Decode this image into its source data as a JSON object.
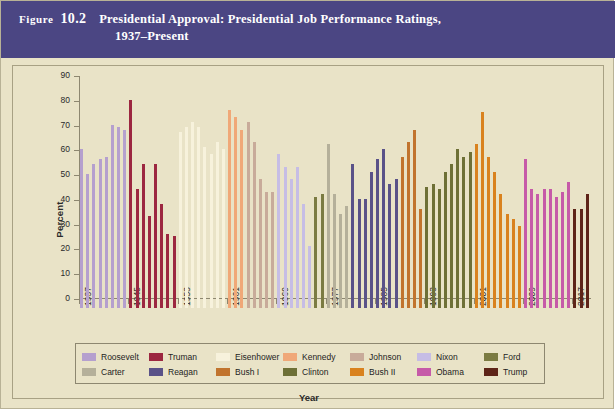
{
  "figure": {
    "label_word": "Figure",
    "number": "10.2",
    "title_line_1": "Presidential Approval: Presidential Job Performance Ratings,",
    "title_line_2": "1937–Present",
    "title_bar_color": "#4b4683",
    "background_color": "#e9e3c7"
  },
  "chart_data": {
    "type": "bar",
    "title": "Presidential Approval: Presidential Job Performance Ratings, 1937–Present",
    "xlabel": "Year",
    "ylabel": "Percent",
    "ylim": [
      0,
      90
    ],
    "ytick_labels": [
      "0",
      "10",
      "20",
      "30",
      "40",
      "50",
      "60",
      "70",
      "80",
      "90"
    ],
    "yticks": [
      0,
      10,
      20,
      30,
      40,
      50,
      60,
      70,
      80,
      90
    ],
    "xtick_labels": [
      "1937",
      "1945",
      "1953",
      "1961",
      "1969",
      "1977",
      "1985",
      "1993",
      "2001",
      "2009",
      "2017"
    ],
    "xticks": [
      1937,
      1945,
      1953,
      1961,
      1969,
      1977,
      1985,
      1993,
      2001,
      2009,
      2017
    ],
    "x_start": 1937,
    "x_end": 2020,
    "grid": false,
    "legend_position": "bottom",
    "series": [
      {
        "name": "Roosevelt",
        "color": "#b5a0ce",
        "x": [
          1937,
          1938,
          1939,
          1940,
          1941,
          1942,
          1943,
          1944
        ],
        "values": [
          64,
          54,
          58,
          60,
          61,
          74,
          73,
          72
        ]
      },
      {
        "name": "Truman",
        "color": "#9c2740",
        "x": [
          1945,
          1946,
          1947,
          1948,
          1949,
          1950,
          1951,
          1952
        ],
        "values": [
          84,
          48,
          58,
          37,
          58,
          42,
          30,
          29
        ]
      },
      {
        "name": "Eisenhower",
        "color": "#f7f2dc",
        "x": [
          1953,
          1954,
          1955,
          1956,
          1957,
          1958,
          1959,
          1960
        ],
        "values": [
          71,
          73,
          75,
          73,
          65,
          62,
          67,
          64
        ]
      },
      {
        "name": "Kennedy",
        "color": "#f0a878",
        "x": [
          1961,
          1962,
          1963
        ],
        "values": [
          80,
          77,
          72
        ]
      },
      {
        "name": "Johnson",
        "color": "#c8ab9a",
        "x": [
          1964,
          1965,
          1966,
          1967,
          1968
        ],
        "values": [
          75,
          67,
          52,
          47,
          47
        ]
      },
      {
        "name": "Nixon",
        "color": "#c6bde5",
        "x": [
          1969,
          1970,
          1971,
          1972,
          1973,
          1974
        ],
        "values": [
          62,
          57,
          52,
          57,
          42,
          25
        ]
      },
      {
        "name": "Ford",
        "color": "#7b7b42",
        "x": [
          1975,
          1976
        ],
        "values": [
          45,
          46
        ]
      },
      {
        "name": "Carter",
        "color": "#b5b09a",
        "x": [
          1977,
          1978,
          1979,
          1980
        ],
        "values": [
          66,
          46,
          38,
          41
        ]
      },
      {
        "name": "Reagan",
        "color": "#5a5288",
        "x": [
          1981,
          1982,
          1983,
          1984,
          1985,
          1986,
          1987,
          1988
        ],
        "values": [
          58,
          44,
          44,
          55,
          60,
          64,
          50,
          52
        ]
      },
      {
        "name": "Bush I",
        "color": "#c1742e",
        "x": [
          1989,
          1990,
          1991,
          1992
        ],
        "values": [
          61,
          67,
          72,
          40
        ]
      },
      {
        "name": "Clinton",
        "color": "#6e7036",
        "x": [
          1993,
          1994,
          1995,
          1996,
          1997,
          1998,
          1999,
          2000
        ],
        "values": [
          49,
          50,
          48,
          55,
          58,
          64,
          61,
          63
        ]
      },
      {
        "name": "Bush II",
        "color": "#d9821e",
        "x": [
          2001,
          2002,
          2003,
          2004,
          2005,
          2006,
          2007,
          2008
        ],
        "values": [
          66,
          79,
          61,
          55,
          46,
          38,
          36,
          33
        ]
      },
      {
        "name": "Obama",
        "color": "#c65aa8",
        "x": [
          2009,
          2010,
          2011,
          2012,
          2013,
          2014,
          2015,
          2016
        ],
        "values": [
          60,
          48,
          46,
          48,
          48,
          45,
          47,
          51
        ]
      },
      {
        "name": "Trump",
        "color": "#5e2418",
        "x": [
          2017,
          2018,
          2019
        ],
        "values": [
          40,
          40,
          46
        ]
      }
    ]
  },
  "legend": {
    "row_1": [
      {
        "label": "Roosevelt",
        "color": "#b5a0ce"
      },
      {
        "label": "Truman",
        "color": "#9c2740"
      },
      {
        "label": "Eisenhower",
        "color": "#f7f2dc"
      },
      {
        "label": "Kennedy",
        "color": "#f0a878"
      },
      {
        "label": "Johnson",
        "color": "#c8ab9a"
      },
      {
        "label": "Nixon",
        "color": "#c6bde5"
      },
      {
        "label": "Ford",
        "color": "#7b7b42"
      }
    ],
    "row_2": [
      {
        "label": "Carter",
        "color": "#b5b09a"
      },
      {
        "label": "Reagan",
        "color": "#5a5288"
      },
      {
        "label": "Bush I",
        "color": "#c1742e"
      },
      {
        "label": "Clinton",
        "color": "#6e7036"
      },
      {
        "label": "Bush II",
        "color": "#d9821e"
      },
      {
        "label": "Obama",
        "color": "#c65aa8"
      },
      {
        "label": "Trump",
        "color": "#5e2418"
      }
    ]
  }
}
